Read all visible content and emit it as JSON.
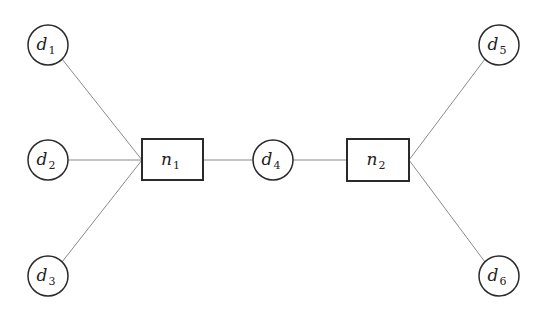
{
  "diagram": {
    "type": "graph",
    "colors": {
      "background": "#ffffff",
      "node_stroke": "#2a2a2a",
      "edge_stroke": "#8a8a8a",
      "text": "#222222"
    },
    "nodes": [
      {
        "id": "d1",
        "shape": "circle",
        "base": "d",
        "sub": "1",
        "cx": 48,
        "cy": 45,
        "r": 20
      },
      {
        "id": "d2",
        "shape": "circle",
        "base": "d",
        "sub": "2",
        "cx": 48,
        "cy": 160,
        "r": 20
      },
      {
        "id": "d3",
        "shape": "circle",
        "base": "d",
        "sub": "3",
        "cx": 48,
        "cy": 276,
        "r": 20
      },
      {
        "id": "n1",
        "shape": "rect",
        "base": "n",
        "sub": "1",
        "x": 142,
        "y": 139,
        "w": 61,
        "h": 41
      },
      {
        "id": "d4",
        "shape": "circle",
        "base": "d",
        "sub": "4",
        "cx": 273,
        "cy": 160,
        "r": 20
      },
      {
        "id": "n2",
        "shape": "rect",
        "base": "n",
        "sub": "2",
        "x": 347,
        "y": 139,
        "w": 62,
        "h": 42
      },
      {
        "id": "d5",
        "shape": "circle",
        "base": "d",
        "sub": "5",
        "cx": 499,
        "cy": 45,
        "r": 20
      },
      {
        "id": "d6",
        "shape": "circle",
        "base": "d",
        "sub": "6",
        "cx": 499,
        "cy": 276,
        "r": 20
      }
    ],
    "edges": [
      {
        "from": "d1",
        "to": "n1",
        "x1": 62,
        "y1": 59,
        "x2": 142,
        "y2": 160
      },
      {
        "from": "d2",
        "to": "n1",
        "x1": 68,
        "y1": 160,
        "x2": 142,
        "y2": 160
      },
      {
        "from": "d3",
        "to": "n1",
        "x1": 62,
        "y1": 262,
        "x2": 142,
        "y2": 160
      },
      {
        "from": "n1",
        "to": "d4",
        "x1": 203,
        "y1": 160,
        "x2": 253,
        "y2": 160
      },
      {
        "from": "d4",
        "to": "n2",
        "x1": 293,
        "y1": 160,
        "x2": 347,
        "y2": 160
      },
      {
        "from": "n2",
        "to": "d5",
        "x1": 409,
        "y1": 160,
        "x2": 485,
        "y2": 59
      },
      {
        "from": "n2",
        "to": "d6",
        "x1": 409,
        "y1": 160,
        "x2": 485,
        "y2": 262
      }
    ]
  }
}
